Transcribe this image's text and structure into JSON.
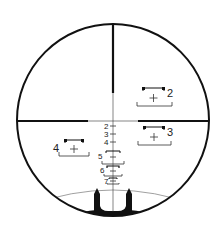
{
  "colors": {
    "ink": "#111111",
    "thin": "#333333",
    "background": "#ffffff",
    "horizon": "#888888"
  },
  "circle": {
    "cx": 113,
    "cy": 120,
    "r": 97
  },
  "crosshair": {
    "vertical_thick_end": 93,
    "horizontal_thick_left_end": 88,
    "horizontal_thick_right_start": 138,
    "y": 121
  },
  "range_boxes": [
    {
      "label": "2",
      "x": 143,
      "y": 89,
      "w": 30
    },
    {
      "label": "3",
      "x": 144,
      "y": 128,
      "w": 28
    },
    {
      "label": "4",
      "x": 64,
      "y": 140,
      "w": 26
    }
  ],
  "stadia": [
    {
      "label": "2",
      "y": 127
    },
    {
      "label": "3",
      "y": 134
    },
    {
      "label": "4",
      "y": 142
    },
    {
      "label": "5",
      "y": 152
    },
    {
      "label": "6",
      "y": 169
    },
    {
      "label": "7",
      "y": 180
    }
  ]
}
